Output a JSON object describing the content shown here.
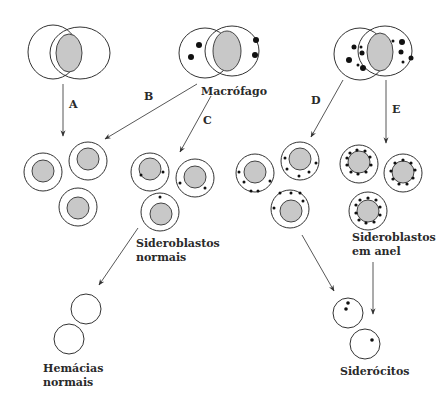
{
  "diagram": {
    "title": "",
    "labels": {
      "macrophage": "Macrófago",
      "path_a": "A",
      "path_b": "B",
      "path_c": "C",
      "path_d": "D",
      "path_e": "E",
      "normal_sideroblasts_line1": "Sideroblastos",
      "normal_sideroblasts_line2": "normais",
      "ring_sideroblasts_line1": "Sideroblastos",
      "ring_sideroblasts_line2": "em anel",
      "normal_rbc_line1": "Hemácias",
      "normal_rbc_line2": "normais",
      "siderocytes": "Siderócitos"
    },
    "nodes": [
      {
        "id": "macrophage-empty",
        "desc": "Macrophage without iron granules"
      },
      {
        "id": "macrophage-normal",
        "desc": "Macrophage with few iron granules"
      },
      {
        "id": "macrophage-overload",
        "desc": "Macrophage with many iron granules"
      },
      {
        "id": "erythroblasts-no-iron",
        "desc": "Three erythroblasts without granules"
      },
      {
        "id": "sideroblasts-normal",
        "desc": "Three erythroblasts with 1-2 granules"
      },
      {
        "id": "sideroblasts-increased",
        "desc": "Three erythroblasts with several scattered granules"
      },
      {
        "id": "sideroblasts-ring",
        "desc": "Three erythroblasts with granules ringing the nucleus"
      },
      {
        "id": "normal-rbc",
        "desc": "Two empty red cells"
      },
      {
        "id": "siderocytes",
        "desc": "Two red cells with iron granules"
      }
    ],
    "edges": [
      {
        "label": "A",
        "from": "macrophage-empty",
        "to": "erythroblasts-no-iron"
      },
      {
        "label": "B",
        "from": "macrophage-normal",
        "to": "erythroblasts-no-iron"
      },
      {
        "label": "C",
        "from": "macrophage-normal",
        "to": "sideroblasts-normal"
      },
      {
        "label": "D",
        "from": "macrophage-overload",
        "to": "sideroblasts-increased"
      },
      {
        "label": "E",
        "from": "macrophage-overload",
        "to": "sideroblasts-ring"
      },
      {
        "label": "",
        "from": "sideroblasts-normal",
        "to": "normal-rbc"
      },
      {
        "label": "",
        "from": "sideroblasts-increased",
        "to": "siderocytes"
      },
      {
        "label": "",
        "from": "sideroblasts-ring",
        "to": "siderocytes"
      }
    ]
  }
}
